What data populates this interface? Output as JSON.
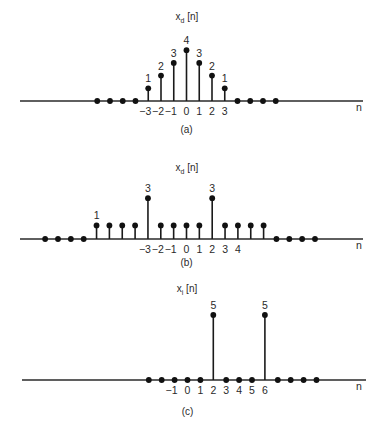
{
  "figure": {
    "panels": [
      {
        "id": "a",
        "title_main": "x",
        "title_sub": "d",
        "title_rest": " [n]",
        "caption": "(a)",
        "axis_label": "n"
      },
      {
        "id": "b",
        "title_main": "x",
        "title_sub": "d",
        "title_rest": " [n]",
        "caption": "(b)",
        "axis_label": "n"
      },
      {
        "id": "c",
        "title_main": "x",
        "title_sub": "i",
        "title_rest": " [n]",
        "caption": "(c)",
        "axis_label": "n"
      }
    ]
  },
  "chart_data": [
    {
      "type": "stem",
      "title": "x_d[n]",
      "caption": "(a)",
      "xlabel": "n",
      "n": [
        -7,
        -6,
        -5,
        -4,
        -3,
        -2,
        -1,
        0,
        1,
        2,
        3,
        4,
        5,
        6,
        7
      ],
      "values": [
        0,
        0,
        0,
        0,
        1,
        2,
        3,
        4,
        3,
        2,
        1,
        0,
        0,
        0,
        0
      ],
      "tick_labels": [
        "-3",
        "-2",
        "-1",
        "0",
        "1",
        "2",
        "3"
      ],
      "tick_positions": [
        -3,
        -2,
        -1,
        0,
        1,
        2,
        3
      ],
      "value_labels": [
        {
          "n": -3,
          "text": "1"
        },
        {
          "n": -2,
          "text": "2"
        },
        {
          "n": -1,
          "text": "3"
        },
        {
          "n": 0,
          "text": "4"
        },
        {
          "n": 1,
          "text": "3"
        },
        {
          "n": 2,
          "text": "2"
        },
        {
          "n": 3,
          "text": "1"
        }
      ]
    },
    {
      "type": "stem",
      "title": "x_d[n]",
      "caption": "(b)",
      "xlabel": "n",
      "n": [
        -11,
        -10,
        -9,
        -8,
        -7,
        -6,
        -5,
        -4,
        -3,
        -2,
        -1,
        0,
        1,
        2,
        3,
        4,
        5,
        6,
        7,
        8,
        9,
        10
      ],
      "values": [
        0,
        0,
        0,
        0,
        1,
        1,
        1,
        1,
        3,
        1,
        1,
        1,
        1,
        3,
        1,
        1,
        1,
        1,
        0,
        0,
        0,
        0
      ],
      "tick_labels": [
        "-3",
        "-2",
        "-1",
        "0",
        "1",
        "2",
        "3",
        "4"
      ],
      "tick_positions": [
        -3,
        -2,
        -1,
        0,
        1,
        2,
        3,
        4
      ],
      "value_labels": [
        {
          "n": -7,
          "text": "1"
        },
        {
          "n": -3,
          "text": "3"
        },
        {
          "n": 2,
          "text": "3"
        }
      ]
    },
    {
      "type": "stem",
      "title": "x_i[n]",
      "caption": "(c)",
      "xlabel": "n",
      "n": [
        -3,
        -2,
        -1,
        0,
        1,
        2,
        3,
        4,
        5,
        6,
        7,
        8,
        9,
        10
      ],
      "values": [
        0,
        0,
        0,
        0,
        0,
        5,
        0,
        0,
        0,
        5,
        0,
        0,
        0,
        0
      ],
      "tick_labels": [
        "-1",
        "0",
        "1",
        "2",
        "3",
        "4",
        "5",
        "6"
      ],
      "tick_positions": [
        -1,
        0,
        1,
        2,
        3,
        4,
        5,
        6
      ],
      "value_labels": [
        {
          "n": 2,
          "text": "5"
        },
        {
          "n": 6,
          "text": "5"
        }
      ]
    }
  ]
}
